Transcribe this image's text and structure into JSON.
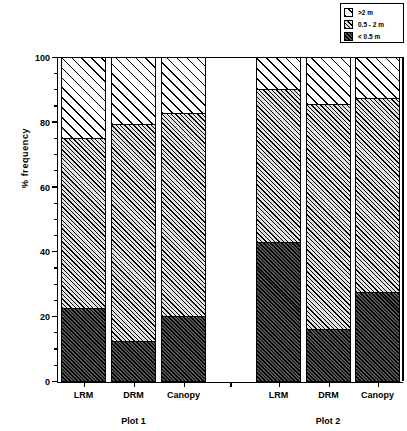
{
  "chart_data": {
    "type": "bar",
    "subtype": "stacked-bar-percent",
    "title": "",
    "xlabel": "",
    "ylabel": "% frequency",
    "ylim": [
      0,
      100
    ],
    "yticks": [
      0,
      20,
      40,
      60,
      80,
      100
    ],
    "ytick_labels": [
      "0",
      "20",
      "40",
      "60",
      "80",
      "100"
    ],
    "y_minor_tick_interval": 5,
    "grid": false,
    "legend_position": "top-right",
    "groups": [
      "Plot 1",
      "Plot 2"
    ],
    "categories": [
      "LRM",
      "DRM",
      "Canopy",
      "LRM",
      "DRM",
      "Canopy"
    ],
    "series": [
      {
        "name": "< 0.5 m",
        "pattern": "dense-hatch-dark",
        "values": [
          22.5,
          12.3,
          20.0,
          43.0,
          16.0,
          27.5
        ]
      },
      {
        "name": "0.5 - 2 m",
        "pattern": "fine-hatch-light",
        "values": [
          52.5,
          67.0,
          62.7,
          47.0,
          69.5,
          60.0
        ]
      },
      {
        "name": ">2 m",
        "pattern": "wide-hatch-white",
        "values": [
          25.0,
          20.7,
          17.3,
          10.0,
          14.5,
          12.5
        ]
      }
    ],
    "cumulative_tops": {
      "lt05": [
        22.5,
        12.3,
        20.0,
        43.0,
        16.0,
        27.5
      ],
      "mid": [
        75.0,
        79.3,
        82.7,
        90.0,
        85.5,
        87.5
      ],
      "gt2": [
        100,
        100,
        100,
        100,
        100,
        100
      ]
    }
  },
  "legend": {
    "items": [
      {
        "label": ">2 m",
        "swatch": "wide-hatch-white"
      },
      {
        "label": "0.5 - 2 m",
        "swatch": "fine-hatch-light"
      },
      {
        "label": "< 0.5 m",
        "swatch": "dense-hatch-dark"
      }
    ]
  },
  "axes": {
    "y_label": "% frequency",
    "y_ticks": [
      "100",
      "80",
      "60",
      "40",
      "20",
      "0"
    ]
  },
  "bars": [
    {
      "category": "LRM",
      "group": "Plot 1",
      "lt05": 22.5,
      "mid": 52.5,
      "gt2": 25.0
    },
    {
      "category": "DRM",
      "group": "Plot 1",
      "lt05": 12.3,
      "mid": 67.0,
      "gt2": 20.7
    },
    {
      "category": "Canopy",
      "group": "Plot 1",
      "lt05": 20.0,
      "mid": 62.7,
      "gt2": 17.3
    },
    {
      "category": "LRM",
      "group": "Plot 2",
      "lt05": 43.0,
      "mid": 47.0,
      "gt2": 10.0
    },
    {
      "category": "DRM",
      "group": "Plot 2",
      "lt05": 16.0,
      "mid": 69.5,
      "gt2": 14.5
    },
    {
      "category": "Canopy",
      "group": "Plot 2",
      "lt05": 27.5,
      "mid": 60.0,
      "gt2": 12.5
    }
  ],
  "group_labels": [
    {
      "text": "Plot 1"
    },
    {
      "text": "Plot 2"
    }
  ]
}
